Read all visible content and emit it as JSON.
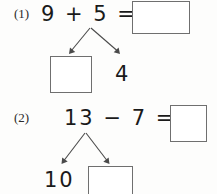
{
  "worksheet": {
    "background_color": "#fdfdfc",
    "ink_color": "#1a1a1a",
    "box_border_color": "#6f6f6f",
    "arrow_color": "#4a4a4a"
  },
  "problems": [
    {
      "number": "(1)",
      "expression": "9 + 5 =",
      "operands": [
        "9",
        "5"
      ],
      "operator": "+",
      "equals": "=",
      "answer_box_value": "",
      "decomposition": {
        "source": "5",
        "left_part_box_value": "",
        "right_part_value": "4"
      }
    },
    {
      "number": "(2)",
      "expression": "13 − 7 =",
      "operands": [
        "13",
        "7"
      ],
      "operator": "−",
      "equals": "=",
      "answer_box_value": "",
      "decomposition": {
        "source": "13",
        "left_part_value": "10",
        "right_part_box_value": ""
      }
    }
  ]
}
